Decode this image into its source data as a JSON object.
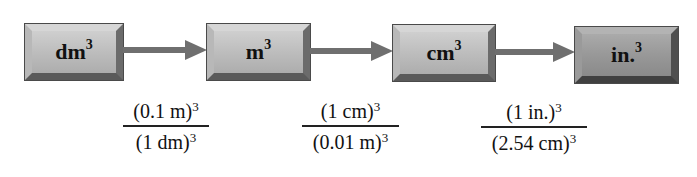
{
  "diagram": {
    "type": "unit-conversion-flow",
    "units": [
      {
        "id": "dm3",
        "base": "dm",
        "exponent": "3",
        "style": "light"
      },
      {
        "id": "m3",
        "base": "m",
        "exponent": "3",
        "style": "light"
      },
      {
        "id": "cm3",
        "base": "cm",
        "exponent": "3",
        "style": "light"
      },
      {
        "id": "in3",
        "base": "in.",
        "exponent": "3",
        "style": "dark"
      }
    ],
    "conversion_factors": [
      {
        "from": "dm3",
        "to": "m3",
        "numerator": {
          "text": "(0.1 m)",
          "exponent": "3"
        },
        "denominator": {
          "text": "(1 dm)",
          "exponent": "3"
        }
      },
      {
        "from": "m3",
        "to": "cm3",
        "numerator": {
          "text": "(1 cm)",
          "exponent": "3"
        },
        "denominator": {
          "text": "(0.01 m)",
          "exponent": "3"
        }
      },
      {
        "from": "cm3",
        "to": "in3",
        "numerator": {
          "text": "(1 in.)",
          "exponent": "3"
        },
        "denominator": {
          "text": "(2.54 cm)",
          "exponent": "3"
        }
      }
    ],
    "colors": {
      "box_face": "#bdbdbd",
      "box_face_dark": "#989898",
      "arrow": "#6f6f6f",
      "text": "#111111",
      "background": "#ffffff"
    }
  }
}
